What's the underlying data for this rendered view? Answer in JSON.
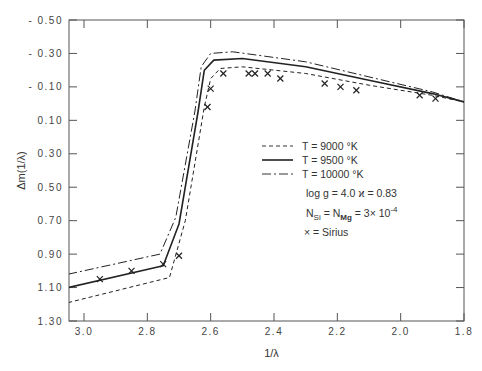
{
  "chart_data": {
    "type": "line",
    "title": "",
    "xlabel": "1/λ",
    "ylabel": "Δm(1/λ)",
    "xlim": [
      3.05,
      1.8
    ],
    "ylim": [
      1.3,
      -0.5
    ],
    "x_inverted": true,
    "y_inverted": true,
    "grid": false,
    "legend_position": "center-right",
    "x_ticks": [
      "3.0",
      "2.8",
      "2.6",
      "2.4",
      "2.2",
      "2.0",
      "1.8"
    ],
    "y_ticks": [
      "-0.50",
      "-0.30",
      "-0.10",
      "0.10",
      "0.30",
      "0.50",
      "0.70",
      "0.90",
      "1.10",
      "1.30"
    ],
    "series": [
      {
        "name": "T = 9000 °K",
        "style": "dashed",
        "x": [
          3.05,
          2.73,
          2.68,
          2.62,
          2.6,
          2.57,
          2.5,
          2.3,
          2.1,
          1.9,
          1.8
        ],
        "y": [
          1.19,
          1.04,
          0.7,
          0.02,
          -0.15,
          -0.21,
          -0.22,
          -0.18,
          -0.11,
          -0.05,
          -0.01
        ]
      },
      {
        "name": "T = 9500 °K",
        "style": "solid",
        "x": [
          3.05,
          2.75,
          2.7,
          2.64,
          2.62,
          2.59,
          2.5,
          2.3,
          2.1,
          1.9,
          1.8
        ],
        "y": [
          1.1,
          0.97,
          0.72,
          0.05,
          -0.2,
          -0.26,
          -0.27,
          -0.22,
          -0.14,
          -0.06,
          -0.01
        ]
      },
      {
        "name": "T = 10000 °K",
        "style": "dashdot",
        "x": [
          3.05,
          2.76,
          2.71,
          2.65,
          2.63,
          2.6,
          2.53,
          2.3,
          2.1,
          1.9,
          1.8
        ],
        "y": [
          1.02,
          0.9,
          0.68,
          0.05,
          -0.22,
          -0.3,
          -0.31,
          -0.25,
          -0.16,
          -0.07,
          -0.01
        ]
      },
      {
        "name": "Sirius",
        "style": "markers-x",
        "x": [
          2.95,
          2.85,
          2.75,
          2.7,
          2.61,
          2.6,
          2.56,
          2.48,
          2.46,
          2.42,
          2.38,
          2.24,
          2.19,
          2.14,
          1.94,
          1.89
        ],
        "y": [
          1.05,
          1.0,
          0.96,
          0.91,
          0.02,
          -0.09,
          -0.18,
          -0.18,
          -0.18,
          -0.18,
          -0.15,
          -0.12,
          -0.1,
          -0.08,
          -0.05,
          -0.03
        ]
      }
    ],
    "annotations": [
      "log g = 4.0  ϰ = 0.83",
      "N_Si = N_Mg = 3×10^-4",
      "× = Sirius"
    ]
  },
  "legend": {
    "items": [
      {
        "label": "T = 9000 °K"
      },
      {
        "label": "T = 9500 °K"
      },
      {
        "label": "T = 10000 °K"
      }
    ],
    "params": "log g = 4.0   ϰ = 0.83",
    "abund_n1": "N",
    "abund_s1": "Si",
    "abund_eq": " = ",
    "abund_n2": "N",
    "abund_s2": "Mg",
    "abund_val": " = 3× 10",
    "abund_exp": "-4",
    "sirius": "×  =  Sirius"
  }
}
